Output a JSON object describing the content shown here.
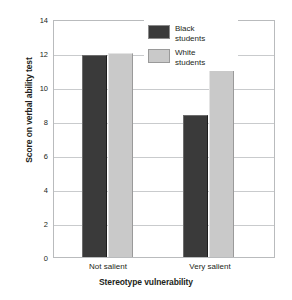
{
  "chart_data": {
    "type": "bar",
    "title": "",
    "xlabel": "Stereotype vulnerability",
    "ylabel": "Score on verbal ability test",
    "categories": [
      "Not salient",
      "Very salient"
    ],
    "series": [
      {
        "name": "Black students",
        "values": [
          12.0,
          8.4
        ],
        "color": "#3a3a3a"
      },
      {
        "name": "White students",
        "values": [
          12.1,
          12.0
        ],
        "color": "#c9c9c9"
      }
    ],
    "ylim": [
      0,
      14
    ],
    "yticks": [
      0,
      2,
      4,
      6,
      8,
      10,
      12,
      14
    ],
    "ytick_labels": [
      "0",
      "2",
      "4",
      "6",
      "8",
      "10",
      "12",
      "14"
    ],
    "grid": "horizontal",
    "legend_position": "top-right-inside"
  },
  "legend": {
    "entries": [
      {
        "label_line1": "Black",
        "label_line2": "students",
        "swatch": "dark-swatch"
      },
      {
        "label_line1": "White",
        "label_line2": "students",
        "swatch": "light-swatch"
      }
    ]
  }
}
